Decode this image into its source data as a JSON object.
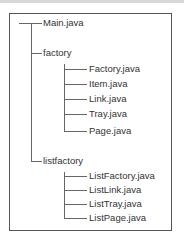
{
  "tree": {
    "root_items": [
      {
        "label": "Main.java",
        "type": "file"
      },
      {
        "label": "factory",
        "type": "folder",
        "children": [
          "Factory.java",
          "Item.java",
          "Link.java",
          "Tray.java",
          "Page.java"
        ]
      },
      {
        "label": "listfactory",
        "type": "folder",
        "children": [
          "ListFactory.java",
          "ListLink.java",
          "ListTray.java",
          "ListPage.java"
        ]
      }
    ]
  },
  "labels": {
    "main": "Main.java",
    "factory": "factory",
    "factory_children": [
      "Factory.java",
      "Item.java",
      "Link.java",
      "Tray.java",
      "Page.java"
    ],
    "listfactory": "listfactory",
    "listfactory_children": [
      "ListFactory.java",
      "ListLink.java",
      "ListTray.java",
      "ListPage.java"
    ]
  },
  "colors": {
    "line": "#666666",
    "text": "#333333",
    "frame": "#555555"
  }
}
